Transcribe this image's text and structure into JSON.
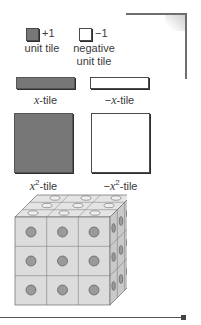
{
  "legend": {
    "unit_tile": {
      "symbol": "+1",
      "label": "unit tile",
      "color": "#777777"
    },
    "negative_unit_tile": {
      "symbol": "−1",
      "label_line1": "negative",
      "label_line2": "unit tile",
      "color": "#ffffff"
    },
    "x_tile": {
      "var": "x",
      "suffix": "-tile",
      "color": "#777777"
    },
    "neg_x_tile": {
      "prefix": "−",
      "var": "x",
      "suffix": "-tile",
      "color": "#ffffff"
    },
    "x2_tile": {
      "var": "x",
      "exp": "2",
      "suffix": "-tile",
      "color": "#777777"
    },
    "neg_x2_tile": {
      "prefix": "−",
      "var": "x",
      "exp": "2",
      "suffix": "-tile",
      "color": "#ffffff"
    }
  },
  "figure": {
    "name": "connecting-cubes",
    "grid": {
      "rows": 3,
      "cols": 3,
      "depth": 3
    }
  }
}
